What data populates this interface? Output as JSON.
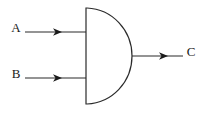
{
  "diagram": {
    "type": "logic-gate-schematic",
    "background_color": "#ffffff",
    "line_color": "#2b2b2b",
    "text_color": "#1a1a1a",
    "gate": {
      "name": "AND",
      "shape": "d-shape",
      "left_edge_x": 86,
      "top_y": 8,
      "bottom_y": 104,
      "right_tip_x": 132,
      "output_y": 56
    },
    "inputs": [
      {
        "label": "A",
        "label_x": 16,
        "label_y": 29,
        "wire_y": 32,
        "wire_start_x": 25,
        "wire_end_x": 86,
        "arrow_tip_x": 62
      },
      {
        "label": "B",
        "label_x": 16,
        "label_y": 75,
        "wire_y": 78,
        "wire_start_x": 25,
        "wire_end_x": 86,
        "arrow_tip_x": 62
      }
    ],
    "outputs": [
      {
        "label": "C",
        "label_x": 191,
        "label_y": 53,
        "wire_y": 56,
        "wire_start_x": 132,
        "wire_end_x": 183,
        "arrow_tip_x": 168
      }
    ]
  }
}
